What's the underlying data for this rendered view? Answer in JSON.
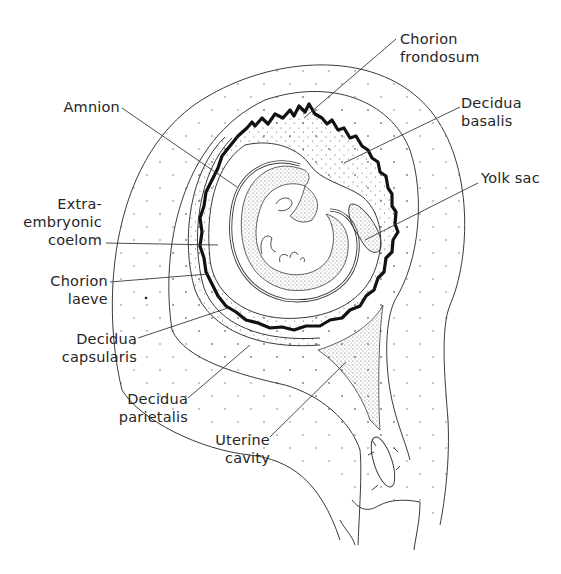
{
  "diagram": {
    "colors": {
      "line": "#3a3a3a",
      "villi": "#111111",
      "stipple": "#5a5a5a",
      "background": "#ffffff",
      "text": "#262626"
    },
    "labels": {
      "chorion_frondosum": {
        "line1": "Chorion",
        "line2": "frondosum"
      },
      "amnion": {
        "line1": "Amnion"
      },
      "decidua_basalis": {
        "line1": "Decidua",
        "line2": "basalis"
      },
      "yolk_sac": {
        "line1": "Yolk sac"
      },
      "extraembryonic_coelom": {
        "line1": "Extra-",
        "line2": "embryonic",
        "line3": "coelom"
      },
      "chorion_laeve": {
        "line1": "Chorion",
        "line2": "laeve"
      },
      "decidua_capsularis": {
        "line1": "Decidua",
        "line2": "capsularis"
      },
      "decidua_parietalis": {
        "line1": "Decidua",
        "line2": "parietalis"
      },
      "uterine_cavity": {
        "line1": "Uterine",
        "line2": "cavity"
      }
    }
  }
}
